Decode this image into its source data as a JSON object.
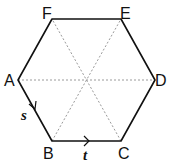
{
  "diagram": {
    "shape": "regular hexagon",
    "vertices": {
      "A": {
        "label": "A"
      },
      "B": {
        "label": "B"
      },
      "C": {
        "label": "C"
      },
      "D": {
        "label": "D"
      },
      "E": {
        "label": "E"
      },
      "F": {
        "label": "F"
      }
    },
    "diagonals": [
      "AD",
      "BE",
      "CF"
    ],
    "vectors": [
      {
        "name": "s",
        "from": "A",
        "to": "B"
      },
      {
        "name": "t",
        "from": "B",
        "to": "C"
      }
    ],
    "colors": {
      "edge": "#111111",
      "diagonal": "#999999",
      "background": "#ffffff"
    }
  }
}
